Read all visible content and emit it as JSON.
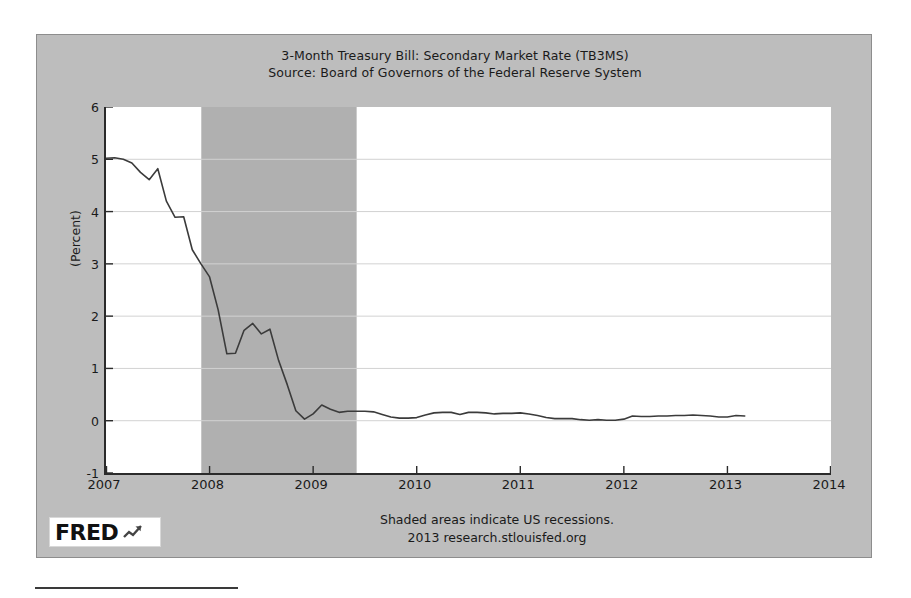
{
  "chart_data": {
    "type": "line",
    "title": "3-Month Treasury Bill: Secondary Market Rate (TB3MS)",
    "subtitle": "Source: Board of Governors of the Federal Reserve System",
    "xlabel": "",
    "ylabel": "(Percent)",
    "xlim": [
      2007.0,
      2014.0
    ],
    "ylim": [
      -1,
      6
    ],
    "x_ticks": [
      "2007",
      "2008",
      "2009",
      "2010",
      "2011",
      "2012",
      "2013",
      "2014"
    ],
    "y_ticks": [
      "-1",
      "0",
      "1",
      "2",
      "3",
      "4",
      "5",
      "6"
    ],
    "grid": true,
    "legend": "none",
    "line_color": "#3b3b3b",
    "recession_color": "#b0b0b0",
    "plot_background": "#ffffff",
    "panel_background": "#bdbdbd",
    "shaded_regions": [
      {
        "label": "US recession",
        "start": 2007.92,
        "end": 2009.42
      }
    ],
    "series": [
      {
        "name": "TB3MS",
        "x": [
          2007.0,
          2007.083,
          2007.167,
          2007.25,
          2007.333,
          2007.417,
          2007.5,
          2007.583,
          2007.667,
          2007.75,
          2007.833,
          2007.917,
          2008.0,
          2008.083,
          2008.167,
          2008.25,
          2008.333,
          2008.417,
          2008.5,
          2008.583,
          2008.667,
          2008.75,
          2008.833,
          2008.917,
          2009.0,
          2009.083,
          2009.167,
          2009.25,
          2009.333,
          2009.417,
          2009.5,
          2009.583,
          2009.667,
          2009.75,
          2009.833,
          2009.917,
          2010.0,
          2010.083,
          2010.167,
          2010.25,
          2010.333,
          2010.417,
          2010.5,
          2010.583,
          2010.667,
          2010.75,
          2010.833,
          2010.917,
          2011.0,
          2011.083,
          2011.167,
          2011.25,
          2011.333,
          2011.417,
          2011.5,
          2011.583,
          2011.667,
          2011.75,
          2011.833,
          2011.917,
          2012.0,
          2012.083,
          2012.167,
          2012.25,
          2012.333,
          2012.417,
          2012.5,
          2012.583,
          2012.667,
          2012.75,
          2012.833,
          2012.917,
          2013.0,
          2013.083,
          2013.167
        ],
        "values": [
          5.02,
          5.03,
          5.0,
          4.93,
          4.75,
          4.61,
          4.82,
          4.2,
          3.89,
          3.9,
          3.27,
          3.0,
          2.75,
          2.12,
          1.28,
          1.29,
          1.73,
          1.86,
          1.66,
          1.75,
          1.15,
          0.69,
          0.19,
          0.03,
          0.13,
          0.3,
          0.22,
          0.16,
          0.18,
          0.18,
          0.18,
          0.17,
          0.12,
          0.07,
          0.05,
          0.05,
          0.06,
          0.11,
          0.15,
          0.16,
          0.16,
          0.12,
          0.16,
          0.16,
          0.15,
          0.13,
          0.14,
          0.14,
          0.15,
          0.13,
          0.1,
          0.06,
          0.04,
          0.04,
          0.04,
          0.02,
          0.01,
          0.02,
          0.01,
          0.01,
          0.03,
          0.09,
          0.08,
          0.08,
          0.09,
          0.09,
          0.1,
          0.1,
          0.11,
          0.1,
          0.09,
          0.07,
          0.07,
          0.1,
          0.09
        ]
      }
    ],
    "annotations": [
      "Shaded areas indicate US recessions.",
      "2013 research.stlouisfed.org"
    ]
  },
  "footer": {
    "note_line1": "Shaded areas indicate US recessions.",
    "note_line2": "2013 research.stlouisfed.org"
  },
  "logo": {
    "text": "FRED",
    "mark": "chart-upward-icon"
  }
}
